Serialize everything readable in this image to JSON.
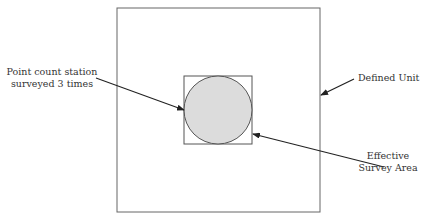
{
  "diagram": {
    "labels": {
      "station_line1": "Point count station",
      "station_line2": "surveyed 3 times",
      "unit": "Defined Unit",
      "area_line1": "Effective",
      "area_line2": "Survey Area"
    },
    "colors": {
      "stroke": "#555555",
      "circle_fill": "#dcdcdc",
      "arrow": "#222222"
    }
  }
}
